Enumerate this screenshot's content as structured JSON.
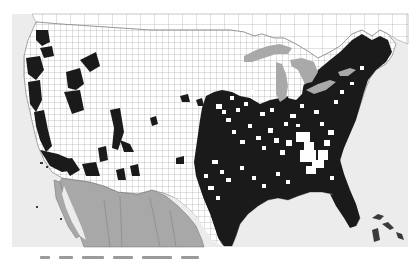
{
  "figure": {
    "type": "choropleth-map",
    "region": "United States (contiguous) by county, with Canada and Mexico context",
    "legend": [],
    "caption_visible": false
  },
  "colors": {
    "ocean": "#ececec",
    "county_fill_absent": "#ffffff",
    "county_fill_present": "#1a1a1a",
    "county_border": "#8c8c8c",
    "lakes": "#a9a9a9",
    "mexico": "#a8a8a8",
    "canada": "#ffffff",
    "page_background": "#ffffff"
  },
  "map": {
    "extent_px": {
      "left": 12,
      "top": 14,
      "right": 408,
      "bottom": 247
    },
    "pattern_summary": "Eastern half of the US is predominantly filled (dark) with scattered unfilled counties, especially in Appalachia, the Southeast piedmont and the Midwest; western US is mostly unfilled with clusters along the Pacific coast (California, Oregon, Washington), Idaho, Utah/Nevada, Arizona and New Mexico."
  }
}
